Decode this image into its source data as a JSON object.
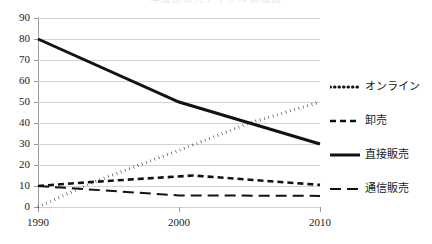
{
  "chart_data": {
    "type": "line",
    "title": "年度別販売チャネル構成比",
    "xlabel": "",
    "ylabel": "",
    "x": [
      1990,
      2000,
      2010
    ],
    "xlim": [
      1990,
      2010
    ],
    "ylim": [
      0,
      90
    ],
    "ytick_labels": [
      "90",
      "80",
      "70",
      "60",
      "50",
      "40",
      "30",
      "20",
      "10",
      "0"
    ],
    "ytick_values": [
      90,
      80,
      70,
      60,
      50,
      40,
      30,
      20,
      10,
      0
    ],
    "xtick_labels": [
      "1990",
      "2000",
      "2010"
    ],
    "grid": "horizontal",
    "legend_position": "right",
    "series": [
      {
        "name": "オンライン",
        "style": "dotted",
        "color": "#121212",
        "points": [
          {
            "x": 1990,
            "y": 0
          },
          {
            "x": 1994,
            "y": 12
          },
          {
            "x": 2000,
            "y": 27
          },
          {
            "x": 2005,
            "y": 40
          },
          {
            "x": 2010,
            "y": 50
          }
        ]
      },
      {
        "name": "卸売",
        "style": "dashed",
        "color": "#121212",
        "points": [
          {
            "x": 1990,
            "y": 10
          },
          {
            "x": 1994,
            "y": 12
          },
          {
            "x": 2001,
            "y": 15
          },
          {
            "x": 2005,
            "y": 13
          },
          {
            "x": 2010,
            "y": 10.5
          }
        ]
      },
      {
        "name": "直接販売",
        "style": "solid",
        "color": "#121212",
        "points": [
          {
            "x": 1990,
            "y": 80
          },
          {
            "x": 2000,
            "y": 50
          },
          {
            "x": 2010,
            "y": 30
          }
        ]
      },
      {
        "name": "通信販売",
        "style": "longdash",
        "color": "#121212",
        "points": [
          {
            "x": 1990,
            "y": 10
          },
          {
            "x": 2000,
            "y": 5.5
          },
          {
            "x": 2010,
            "y": 5.3
          }
        ]
      }
    ]
  },
  "legend": {
    "items": [
      {
        "label": "オンライン",
        "swatch": "dotted-line-swatch"
      },
      {
        "label": "卸売",
        "swatch": "dashed-line-swatch"
      },
      {
        "label": "直接販売",
        "swatch": "solid-line-swatch"
      },
      {
        "label": "通信販売",
        "swatch": "longdash-line-swatch"
      }
    ]
  },
  "axes": {
    "y_labels": [
      "90",
      "80",
      "70",
      "60",
      "50",
      "40",
      "30",
      "20",
      "10",
      "0"
    ],
    "x_labels": [
      "1990",
      "2000",
      "2010"
    ]
  }
}
